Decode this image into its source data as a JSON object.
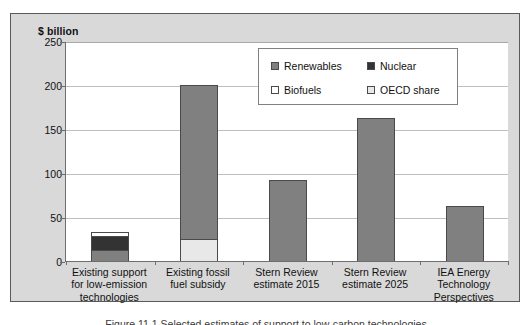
{
  "chart_data": {
    "type": "bar",
    "title": "",
    "subtitle": "",
    "xlabel": "",
    "ylabel": "$ billion",
    "ylim": [
      0,
      250
    ],
    "yticks": [
      0,
      50,
      100,
      150,
      200,
      250
    ],
    "grid": true,
    "stacked": true,
    "legend_position": "upper-right-inside",
    "categories": [
      "Existing support for low-emission technologies",
      "Existing fossil fuel subsidy",
      "Stern Review estimate 2015",
      "Stern Review estimate 2025",
      "IEA Energy Technology Perspectives"
    ],
    "category_lines": [
      [
        "Existing support",
        "for low-emission",
        "technologies"
      ],
      [
        "Existing fossil",
        "fuel subsidy"
      ],
      [
        "Stern Review",
        "estimate 2015"
      ],
      [
        "Stern Review",
        "estimate 2025"
      ],
      [
        "IEA Energy",
        "Technology",
        "Perspectives"
      ]
    ],
    "series": [
      {
        "name": "Renewables",
        "color": "#808080",
        "values": [
          12,
          175,
          92,
          163,
          62
        ]
      },
      {
        "name": "Nuclear",
        "color": "#333333",
        "values": [
          16,
          0,
          0,
          0,
          0
        ]
      },
      {
        "name": "Biofuels",
        "color": "#ffffff",
        "values": [
          5,
          0,
          0,
          0,
          0
        ]
      },
      {
        "name": "OECD share",
        "color": "#e8e8e8",
        "values": [
          0,
          25,
          0,
          0,
          0
        ]
      }
    ],
    "bar_totals": [
      33,
      200,
      92,
      163,
      62
    ]
  },
  "legend": {
    "items": [
      {
        "label": "Renewables",
        "color": "#808080"
      },
      {
        "label": "Nuclear",
        "color": "#333333"
      },
      {
        "label": "Biofuels",
        "color": "#ffffff"
      },
      {
        "label": "OECD share",
        "color": "#e8e8e8"
      }
    ]
  },
  "axis": {
    "title": "$ billion",
    "ticks": [
      "250",
      "200",
      "150",
      "100",
      "50",
      "0"
    ]
  },
  "caption": {
    "text": "Figure 11.1  Selected estimates of support to low-carbon technologies"
  },
  "colors": {
    "panel_background": "#d9d9d9",
    "plot_background": "#ffffff",
    "axis_line": "#6e6e6e",
    "gridline": "#bfbfbf",
    "bar_outline": "#4a4a4a",
    "renewables": "#808080",
    "nuclear": "#333333",
    "biofuels": "#ffffff",
    "oecd_share": "#e8e8e8"
  }
}
